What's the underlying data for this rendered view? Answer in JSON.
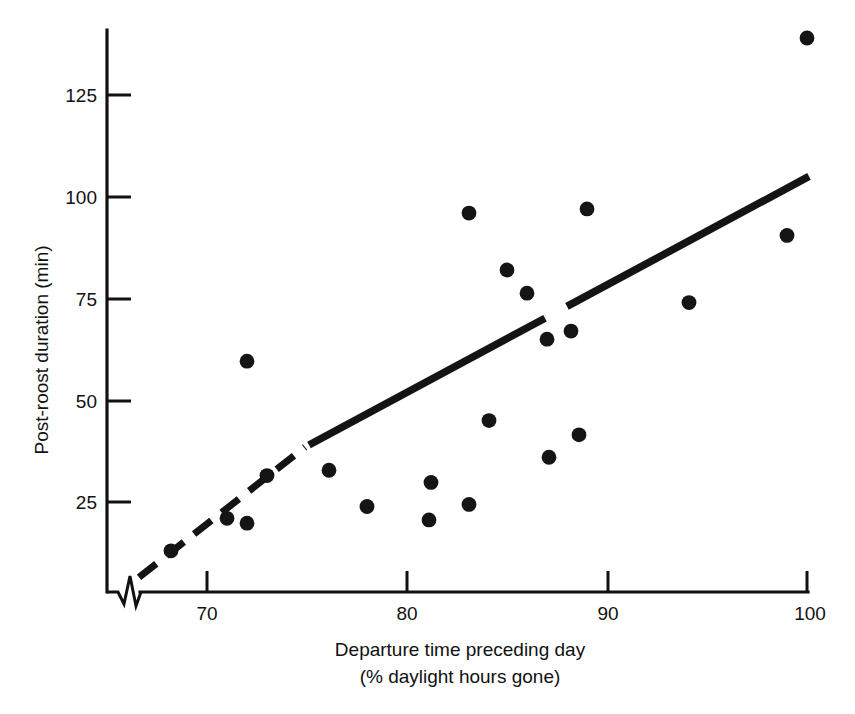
{
  "chart_data": {
    "type": "scatter",
    "title": "",
    "xlabel": "Departure time preceding day",
    "xlabel_line2": "(% daylight hours gone)",
    "ylabel": "Post-roost duration (min)",
    "xlim": [
      66,
      101.5
    ],
    "ylim": [
      0,
      143
    ],
    "xticks": [
      70,
      80,
      90,
      100
    ],
    "xticklabels": [
      "70",
      "80",
      "90",
      "100"
    ],
    "yticks": [
      25,
      50,
      75,
      100,
      125
    ],
    "yticklabels": [
      "25",
      "50",
      "75",
      "100",
      "125"
    ],
    "grid": false,
    "legend": null,
    "axis_break": {
      "axis": "x",
      "symbol": "zigzag",
      "position_value": 66.8,
      "note": "x-axis broken near origin"
    },
    "points": [
      {
        "x": 68.2,
        "y": 13
      },
      {
        "x": 71.0,
        "y": 21
      },
      {
        "x": 72.0,
        "y": 19.8
      },
      {
        "x": 72.0,
        "y": 59.6
      },
      {
        "x": 73.0,
        "y": 31.5
      },
      {
        "x": 76.1,
        "y": 32.8
      },
      {
        "x": 78.0,
        "y": 23.9
      },
      {
        "x": 81.1,
        "y": 20.6
      },
      {
        "x": 81.2,
        "y": 29.8
      },
      {
        "x": 83.1,
        "y": 24.4
      },
      {
        "x": 83.1,
        "y": 96.0
      },
      {
        "x": 84.1,
        "y": 45.0
      },
      {
        "x": 85.0,
        "y": 82.0
      },
      {
        "x": 86.0,
        "y": 76.3
      },
      {
        "x": 87.0,
        "y": 65.0
      },
      {
        "x": 87.1,
        "y": 36.0
      },
      {
        "x": 88.6,
        "y": 41.5
      },
      {
        "x": 88.2,
        "y": 67.0
      },
      {
        "x": 89.0,
        "y": 97.0
      },
      {
        "x": 94.1,
        "y": 74.0
      },
      {
        "x": 99.0,
        "y": 90.5
      },
      {
        "x": 100.0,
        "y": 139.0
      }
    ],
    "fit_line": {
      "style": "solid-with-gap",
      "x_start": 75.1,
      "y_start": 39.0,
      "x_end": 100.1,
      "y_end": 105.0,
      "gap_x_from": 86.9,
      "gap_x_to": 88.0,
      "dashed_extension": {
        "x_start": 66.6,
        "y_start": 6.5,
        "x_end": 74.9,
        "y_end": 38.5
      }
    }
  },
  "axes": {
    "y_axis_label": "Post-roost duration (min)",
    "x_axis_label_line1": "Departure time preceding day",
    "x_axis_label_line2": "(% daylight hours gone)"
  },
  "colors": {
    "ink": "#111111",
    "marker": "#151515",
    "background": "#ffffff"
  }
}
